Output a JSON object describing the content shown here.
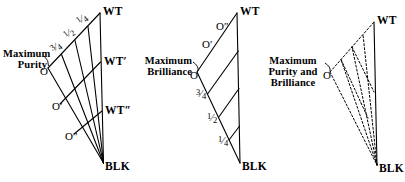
{
  "figure": {
    "type": "diagram",
    "background_color": "#ffffff",
    "line_color": "#000000",
    "panels": [
      {
        "id": "panel-purity",
        "caption_lines": [
          "Maximum",
          "Purity"
        ],
        "vertex_labels": [
          "WT",
          "WT'",
          "WT″",
          "BLK"
        ],
        "origin_labels": [
          "O",
          "O'",
          "O″"
        ],
        "fraction_labels": [
          "¾",
          "½",
          "¼"
        ],
        "line_style": "solid"
      },
      {
        "id": "panel-brilliance",
        "caption_lines": [
          "Maximum",
          "Brilliance"
        ],
        "vertex_labels": [
          "WT",
          "BLK"
        ],
        "origin_labels": [
          "O",
          "O'",
          "O″"
        ],
        "fraction_labels": [
          "¾",
          "½",
          "¼"
        ],
        "line_style": "solid"
      },
      {
        "id": "panel-purity-and-brilliance",
        "caption_lines": [
          "Maximum",
          "Purity and",
          "Brilliance"
        ],
        "vertex_labels": [
          "WT",
          "BLK"
        ],
        "origin_labels": [
          "O"
        ],
        "fraction_labels": [],
        "line_style": "dashed"
      }
    ]
  },
  "panel1": {
    "caption_line1": "Maximum",
    "caption_line2": "Purity",
    "wt": "WT",
    "wt_prime": "WT′",
    "wt_dprime": "WT″",
    "blk": "BLK",
    "o": "O",
    "o_prime": "O′",
    "o_dprime": "O″",
    "frac_three_quarter_num": "3",
    "frac_three_quarter_den": "4",
    "frac_half_num": "1",
    "frac_half_den": "2",
    "frac_quarter_num": "1",
    "frac_quarter_den": "4"
  },
  "panel2": {
    "caption_line1": "Maximum",
    "caption_line2": "Brilliance",
    "wt": "WT",
    "blk": "BLK",
    "o": "O",
    "o_prime": "O′",
    "o_dprime": "O″",
    "frac_three_quarter_num": "3",
    "frac_three_quarter_den": "4",
    "frac_half_num": "1",
    "frac_half_den": "2",
    "frac_quarter_num": "1",
    "frac_quarter_den": "4"
  },
  "panel3": {
    "caption_line1": "Maximum",
    "caption_line2": "Purity and",
    "caption_line3": "Brilliance",
    "wt": "WT",
    "blk": "BLK",
    "o": "O"
  }
}
